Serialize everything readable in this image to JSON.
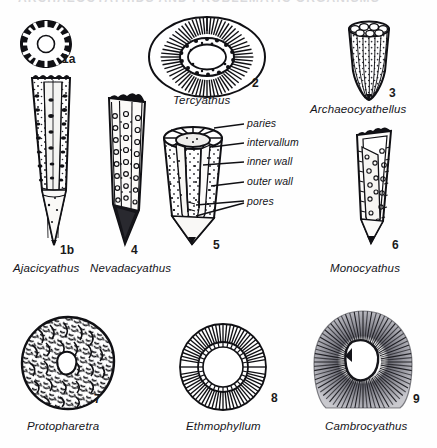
{
  "plate": {
    "top_partial_text": "ARCHAEOCYATHIDS  AND  PROBLEMATIC  ORGANISMS",
    "background": "#fefefe",
    "ink": "#15151a"
  },
  "figures": [
    {
      "id": "1a",
      "number": "1a",
      "genus": "",
      "caption_for": "Ajacicyathus",
      "kind": "transverse-section-radial-septa"
    },
    {
      "id": "1b",
      "number": "1b",
      "genus": "Ajacicyathus",
      "kind": "cup-longitudinal-cutaway-porous"
    },
    {
      "id": "2",
      "number": "2",
      "genus": "Tercyathus",
      "kind": "transverse-section-oval-radial"
    },
    {
      "id": "3",
      "number": "3",
      "genus": "Archaeocyathellus",
      "kind": "conical-cup-exterior"
    },
    {
      "id": "4",
      "number": "4",
      "genus": "Nevadacyathus",
      "kind": "cup-longitudinal-pore-rows"
    },
    {
      "id": "5",
      "number": "5",
      "genus": "",
      "caption_for": "labelled-diagram",
      "kind": "cut-away-labelled-cup"
    },
    {
      "id": "6",
      "number": "6",
      "genus": "Monocyathus",
      "kind": "simple-cone-single-wall"
    },
    {
      "id": "7",
      "number": "7",
      "genus": "Protopharetra",
      "kind": "transverse-section-irregular-vesicular"
    },
    {
      "id": "8",
      "number": "8",
      "genus": "Ethmophyllum",
      "kind": "transverse-section-circular-septa"
    },
    {
      "id": "9",
      "number": "9",
      "genus": "Cambrocyathus",
      "kind": "transverse-section-fibrous-spinose"
    }
  ],
  "annotations": [
    {
      "label": "paries",
      "target": "outer-porous-wall-top"
    },
    {
      "label": "intervallum",
      "target": "space-between-walls"
    },
    {
      "label": "inner wall",
      "target": "inner-wall"
    },
    {
      "label": "outer wall",
      "target": "outer-wall"
    },
    {
      "label": "pores",
      "target": "wall-perforations"
    }
  ]
}
